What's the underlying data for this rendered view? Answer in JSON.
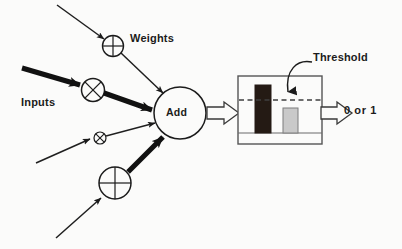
{
  "diagram": {
    "labels": {
      "weights": "Weights",
      "inputs": "Inputs",
      "add": "Add",
      "threshold": "Threshold",
      "output": "0  or  1"
    },
    "colors": {
      "background": "#fbfbfa",
      "stroke": "#1b1b1b",
      "thin_stroke": "#2a2a2a",
      "text": "#1b1b1b",
      "bar_dark": "#241a14",
      "bar_light": "#c9c9c9",
      "bar_light_stroke": "#7d7d7d",
      "box_stroke": "#555555",
      "dashed_line": "#4a4a4a",
      "hollow_arrow_fill": "#fbfbfa"
    },
    "nodes": [
      {
        "name": "weight-circle-1",
        "shape": "circle-plus",
        "cx": 113,
        "cy": 46,
        "r": 10.5
      },
      {
        "name": "weight-circle-2",
        "shape": "circle-cross",
        "cx": 93,
        "cy": 90,
        "r": 11.5
      },
      {
        "name": "weight-circle-3",
        "shape": "circle-cross",
        "cx": 100,
        "cy": 138,
        "r": 6
      },
      {
        "name": "weight-circle-4",
        "shape": "circle-plus",
        "cx": 115,
        "cy": 183,
        "r": 16
      },
      {
        "name": "summation-node",
        "shape": "circle",
        "cx": 180,
        "cy": 113,
        "r": 26
      }
    ],
    "threshold_box": {
      "name": "threshold-box",
      "x": 238,
      "y": 76,
      "width": 84,
      "height": 68,
      "baseline_y": 133,
      "threshold_line_y": 100,
      "bars": [
        {
          "name": "bar-above-threshold",
          "x": 255,
          "y": 85,
          "width": 16,
          "height": 48,
          "fill": "dark"
        },
        {
          "name": "bar-below-threshold",
          "x": 283,
          "y": 108,
          "width": 15,
          "height": 25,
          "fill": "light"
        }
      ]
    },
    "connections": [
      {
        "name": "input-line-1",
        "style": "thin",
        "from": [
          57,
          5
        ],
        "to": [
          104,
          39
        ]
      },
      {
        "name": "input-line-2",
        "style": "thick",
        "from": [
          22,
          68
        ],
        "to": [
          84,
          86
        ]
      },
      {
        "name": "input-line-3",
        "style": "thin",
        "from": [
          36,
          163
        ],
        "to": [
          93,
          138
        ]
      },
      {
        "name": "input-line-4",
        "style": "thin",
        "from": [
          56,
          238
        ],
        "to": [
          104,
          195
        ]
      },
      {
        "name": "weight-to-sum-1",
        "style": "thin",
        "from": [
          122,
          54
        ],
        "to": [
          166,
          95
        ]
      },
      {
        "name": "weight-to-sum-2",
        "style": "thick",
        "from": [
          104,
          94
        ],
        "to": [
          156,
          111
        ]
      },
      {
        "name": "weight-to-sum-3",
        "style": "thin",
        "from": [
          107,
          136
        ],
        "to": [
          158,
          122
        ]
      },
      {
        "name": "weight-to-sum-4",
        "style": "thick",
        "from": [
          128,
          172
        ],
        "to": [
          167,
          134
        ]
      }
    ],
    "hollow_arrows": [
      {
        "name": "sum-to-threshold-arrow",
        "from_x": 208,
        "to_x": 240,
        "y": 113
      },
      {
        "name": "threshold-to-output-arrow",
        "from_x": 320,
        "to_x": 342,
        "y": 113
      }
    ],
    "threshold_pointer": {
      "name": "threshold-leader-arrow",
      "path": "M 311 62 C 296 60, 286 72, 288 94",
      "arrow_tip": [
        289,
        102
      ]
    }
  }
}
